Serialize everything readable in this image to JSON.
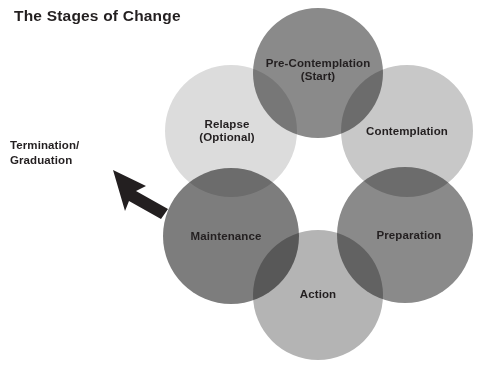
{
  "title": "The Stages of Change",
  "diagram": {
    "type": "cycle-venn",
    "annotation": {
      "label_line1": "Termination/",
      "label_line2": "Graduation",
      "arrow_icon": "arrow-up-left-icon",
      "arrow_color": "#231f20"
    },
    "stages": [
      {
        "id": "pre-contemplation",
        "line1": "Pre-Contemplation",
        "line2": "(Start)",
        "color": "#8a8a8a",
        "cx": 318,
        "cy": 73,
        "r": 65,
        "label_x": 318,
        "label_y": 70
      },
      {
        "id": "contemplation",
        "line1": "Contemplation",
        "line2": "",
        "color": "#c8c8c8",
        "cx": 407,
        "cy": 131,
        "r": 66,
        "label_x": 407,
        "label_y": 131
      },
      {
        "id": "preparation",
        "line1": "Preparation",
        "line2": "",
        "color": "#8a8a8a",
        "cx": 405,
        "cy": 235,
        "r": 68,
        "label_x": 409,
        "label_y": 235
      },
      {
        "id": "action",
        "line1": "Action",
        "line2": "",
        "color": "#b4b4b4",
        "cx": 318,
        "cy": 295,
        "r": 65,
        "label_x": 318,
        "label_y": 294
      },
      {
        "id": "maintenance",
        "line1": "Maintenance",
        "line2": "",
        "color": "#7d7d7d",
        "cx": 231,
        "cy": 236,
        "r": 68,
        "label_x": 226,
        "label_y": 236
      },
      {
        "id": "relapse",
        "line1": "Relapse",
        "line2": "(Optional)",
        "color": "#dcdcdc",
        "cx": 231,
        "cy": 131,
        "r": 66,
        "label_x": 227,
        "label_y": 131
      }
    ]
  }
}
